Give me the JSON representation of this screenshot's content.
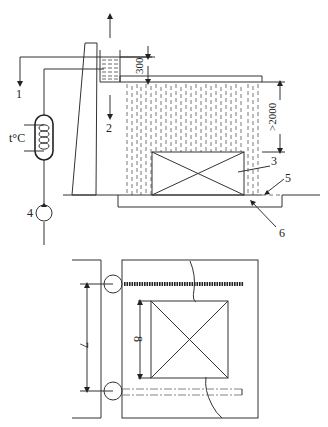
{
  "diagram": {
    "type": "cooling-tower-spray-test-schematic",
    "elevation_view": {
      "labels": {
        "outlet_1": "1",
        "inlet_2": "2",
        "specimen_3": "3",
        "pump_4": "4",
        "nozzle_5": "5",
        "basin_6": "6"
      },
      "heater_label": "t°C",
      "dimensions": {
        "tank_height": "300",
        "spray_height": ">2000"
      }
    },
    "plan_view": {
      "labels": {
        "distance_7": "7",
        "distance_8": "8"
      }
    },
    "colors": {
      "line": "#333333",
      "background": "#ffffff"
    }
  }
}
